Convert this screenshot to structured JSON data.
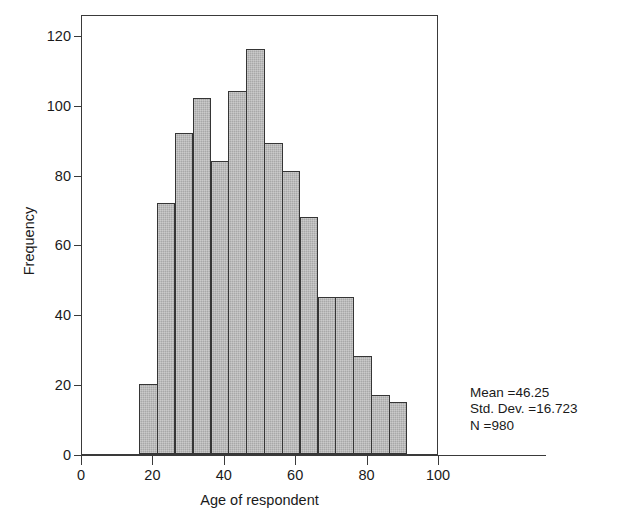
{
  "chart_data": {
    "type": "bar",
    "title": "",
    "subtitle": "",
    "xlabel": "Age of respondent",
    "ylabel": "Frequency",
    "xlim": [
      0,
      100
    ],
    "ylim": [
      0,
      126
    ],
    "grid": false,
    "legend": false,
    "bin_width": 5,
    "bin_starts": [
      16,
      21,
      26,
      31,
      36,
      41,
      46,
      51,
      56,
      61,
      66,
      71,
      76,
      81,
      86
    ],
    "categories": [
      "16-21",
      "21-26",
      "26-31",
      "31-36",
      "36-41",
      "41-46",
      "46-51",
      "51-56",
      "56-61",
      "61-66",
      "66-71",
      "71-76",
      "76-81",
      "81-86",
      "86-91"
    ],
    "values": [
      20,
      72,
      92,
      102,
      84,
      104,
      116,
      89,
      81,
      68,
      45,
      45,
      28,
      17,
      15
    ],
    "xticks": [
      0,
      20,
      40,
      60,
      80,
      100
    ],
    "xtick_labels": [
      "0",
      "20",
      "40",
      "60",
      "80",
      "100"
    ],
    "yticks": [
      0,
      20,
      40,
      60,
      80,
      100,
      120
    ],
    "ytick_labels": [
      "0",
      "20",
      "40",
      "60",
      "80",
      "100",
      "120"
    ],
    "bar_fill_color": "#a8a8a8",
    "bar_edge_color": "#353535",
    "axis_color": "#3a3a3a",
    "annotations": {
      "mean": "Mean =46.25",
      "std_dev": "Std. Dev. =16.723",
      "n": "N =980"
    }
  }
}
